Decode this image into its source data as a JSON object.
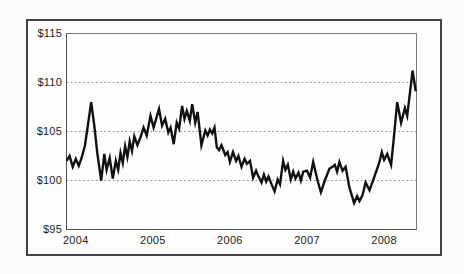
{
  "figure": {
    "background": "#fbfbf9",
    "frame_color": "#434343",
    "plot_border_color": "#7a7a7a",
    "axis_color": "#525252",
    "gridline_color": "#8f8f8f",
    "line_color": "#111111",
    "label_color": "#1c1c1c"
  },
  "chart_data": {
    "type": "line",
    "title": "",
    "xlabel": "",
    "ylabel": "",
    "legend": "none",
    "grid": "dotted-horizontal",
    "xlim": [
      2003.88,
      2008.42
    ],
    "ylim": [
      95,
      115
    ],
    "y_ticks": [
      {
        "value": 115,
        "label": "$115"
      },
      {
        "value": 110,
        "label": "$110"
      },
      {
        "value": 105,
        "label": "$105"
      },
      {
        "value": 100,
        "label": "$100"
      },
      {
        "value": 95,
        "label": "$95"
      }
    ],
    "gridlines_y": [
      110,
      105,
      100
    ],
    "x_ticks": [
      {
        "value": 2004,
        "label": "2004"
      },
      {
        "value": 2005,
        "label": "2005"
      },
      {
        "value": 2006,
        "label": "2006"
      },
      {
        "value": 2007,
        "label": "2007"
      },
      {
        "value": 2008,
        "label": "2008"
      }
    ],
    "series": [
      {
        "name": "price",
        "color": "#111111",
        "x": [
          2003.88,
          2003.92,
          2003.96,
          2004.0,
          2004.04,
          2004.08,
          2004.12,
          2004.16,
          2004.2,
          2004.24,
          2004.28,
          2004.33,
          2004.37,
          2004.4,
          2004.44,
          2004.48,
          2004.52,
          2004.55,
          2004.58,
          2004.61,
          2004.64,
          2004.67,
          2004.7,
          2004.73,
          2004.76,
          2004.8,
          2004.84,
          2004.88,
          2004.92,
          2004.97,
          2005.01,
          2005.08,
          2005.12,
          2005.16,
          2005.2,
          2005.23,
          2005.27,
          2005.31,
          2005.34,
          2005.38,
          2005.41,
          2005.44,
          2005.48,
          2005.51,
          2005.55,
          2005.58,
          2005.63,
          2005.68,
          2005.71,
          2005.74,
          2005.77,
          2005.8,
          2005.83,
          2005.86,
          2005.89,
          2005.94,
          2005.97,
          2006.0,
          2006.04,
          2006.08,
          2006.11,
          2006.15,
          2006.19,
          2006.22,
          2006.26,
          2006.3,
          2006.34,
          2006.37,
          2006.41,
          2006.44,
          2006.47,
          2006.5,
          2006.54,
          2006.58,
          2006.62,
          2006.65,
          2006.69,
          2006.72,
          2006.75,
          2006.79,
          2006.82,
          2006.85,
          2006.89,
          2006.92,
          2006.95,
          2007.0,
          2007.04,
          2007.08,
          2007.14,
          2007.18,
          2007.23,
          2007.29,
          2007.33,
          2007.36,
          2007.39,
          2007.42,
          2007.46,
          2007.5,
          2007.55,
          2007.61,
          2007.65,
          2007.68,
          2007.72,
          2007.76,
          2007.81,
          2007.87,
          2007.94,
          2007.97,
          2008.0,
          2008.04,
          2008.09,
          2008.12,
          2008.17,
          2008.22,
          2008.27,
          2008.3,
          2008.37,
          2008.41
        ],
        "y": [
          102.0,
          102.5,
          101.4,
          102.2,
          101.5,
          102.4,
          103.6,
          105.8,
          108.0,
          105.6,
          102.8,
          100.0,
          102.7,
          101.1,
          102.3,
          100.2,
          102.0,
          101.1,
          102.8,
          101.8,
          103.5,
          102.4,
          104.0,
          103.0,
          104.5,
          103.6,
          104.4,
          105.4,
          104.6,
          106.6,
          105.4,
          107.3,
          105.6,
          106.3,
          104.9,
          105.4,
          103.7,
          105.9,
          105.3,
          107.6,
          106.3,
          107.1,
          106.1,
          107.8,
          105.9,
          107.0,
          103.6,
          105.1,
          104.6,
          105.2,
          104.8,
          105.4,
          103.4,
          103.1,
          103.6,
          102.6,
          102.9,
          101.9,
          102.9,
          102.0,
          102.5,
          101.4,
          102.2,
          101.7,
          102.0,
          100.3,
          101.0,
          100.4,
          99.8,
          100.6,
          99.9,
          100.4,
          99.6,
          98.9,
          100.1,
          99.6,
          102.0,
          101.1,
          101.6,
          100.1,
          100.9,
          100.2,
          100.8,
          100.0,
          100.9,
          101.0,
          100.3,
          101.9,
          99.9,
          98.8,
          100.0,
          101.2,
          101.4,
          101.6,
          100.9,
          101.9,
          101.0,
          101.4,
          99.3,
          97.7,
          98.4,
          97.9,
          98.5,
          99.8,
          99.0,
          100.3,
          101.9,
          102.9,
          102.1,
          102.7,
          101.6,
          103.9,
          108.0,
          105.9,
          107.4,
          106.6,
          111.2,
          109.1
        ]
      }
    ]
  }
}
